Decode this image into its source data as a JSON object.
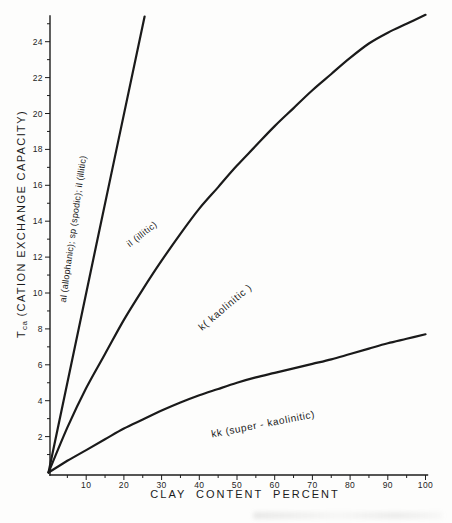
{
  "chart_data": {
    "type": "line",
    "title": "",
    "xlabel": "CLAY CONTENT PERCENT",
    "ylabel": "Tca (CATION EXCHANGE CAPACITY)",
    "ylabel_parts": {
      "main": "T",
      "sub": "ca",
      "rest": "(CATION EXCHANGE CAPACITY)"
    },
    "xlim": [
      0,
      100
    ],
    "ylim": [
      0,
      25.5
    ],
    "grid": false,
    "legend": "none",
    "x_ticks_major": [
      10,
      20,
      30,
      40,
      50,
      60,
      70,
      80,
      90,
      100
    ],
    "x_ticks_minor": [
      5,
      15,
      25,
      35,
      45,
      55,
      65,
      75,
      85,
      95
    ],
    "y_ticks_major": [
      2,
      4,
      6,
      8,
      10,
      12,
      14,
      16,
      18,
      20,
      22,
      24
    ],
    "y_ticks_minor": [
      1,
      3,
      5,
      7,
      9,
      11,
      13,
      15,
      17,
      19,
      21,
      23,
      25
    ],
    "series": [
      {
        "id": "al-sp-il-line",
        "label": "al (allophanic); sp (spodic); il (illitic)",
        "points": [
          [
            0,
            0
          ],
          [
            12.7,
            12.7
          ],
          [
            25.5,
            25.4
          ]
        ]
      },
      {
        "id": "il-curve",
        "label": "il (illitic)",
        "points": [
          [
            0,
            0
          ],
          [
            5,
            2.5
          ],
          [
            10,
            4.7
          ],
          [
            15,
            6.6
          ],
          [
            20,
            8.5
          ],
          [
            25,
            10.2
          ],
          [
            30,
            11.8
          ],
          [
            35,
            13.3
          ],
          [
            40,
            14.7
          ],
          [
            45,
            15.9
          ],
          [
            50,
            17.1
          ],
          [
            55,
            18.2
          ],
          [
            60,
            19.3
          ],
          [
            65,
            20.3
          ],
          [
            70,
            21.3
          ],
          [
            75,
            22.2
          ],
          [
            80,
            23.1
          ],
          [
            85,
            23.9
          ],
          [
            90,
            24.5
          ],
          [
            95,
            25.0
          ],
          [
            100,
            25.5
          ]
        ]
      },
      {
        "id": "k-kk-curve",
        "label": "k / kk boundary",
        "points": [
          [
            0,
            0
          ],
          [
            5,
            0.65
          ],
          [
            10,
            1.25
          ],
          [
            15,
            1.85
          ],
          [
            20,
            2.45
          ],
          [
            25,
            2.95
          ],
          [
            30,
            3.45
          ],
          [
            35,
            3.9
          ],
          [
            40,
            4.3
          ],
          [
            45,
            4.65
          ],
          [
            50,
            5.0
          ],
          [
            55,
            5.3
          ],
          [
            60,
            5.55
          ],
          [
            65,
            5.8
          ],
          [
            70,
            6.05
          ],
          [
            75,
            6.3
          ],
          [
            80,
            6.6
          ],
          [
            85,
            6.9
          ],
          [
            90,
            7.2
          ],
          [
            95,
            7.45
          ],
          [
            100,
            7.7
          ]
        ]
      }
    ],
    "curve_labels": [
      {
        "text": "al (allophanic); sp (spodic); il (illitic)"
      },
      {
        "text": "il (illitic)"
      },
      {
        "text": "k( kaolinitic )"
      },
      {
        "text": "kk (super - kaolinitic)"
      }
    ],
    "colors": {
      "ink": "#1a1a1a",
      "background": "#fdfdfc"
    }
  }
}
